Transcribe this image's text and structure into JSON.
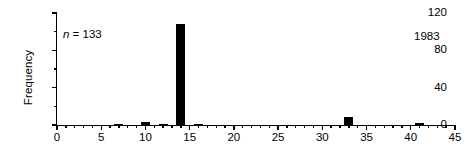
{
  "chart_data": {
    "type": "bar",
    "title": "",
    "xlabel": "",
    "ylabel": "Frequency",
    "xlim": [
      0,
      45
    ],
    "ylim": [
      0,
      120
    ],
    "grid": false,
    "legend": null,
    "x_major_ticks": [
      0,
      5,
      10,
      15,
      20,
      25,
      30,
      35,
      40,
      45
    ],
    "x_major_tick_labels": [
      "0",
      "5",
      "10",
      "15",
      "20",
      "25",
      "30",
      "35",
      "40",
      "45"
    ],
    "x_minor_tick_step": 1,
    "y_major_ticks": [
      0,
      40,
      80,
      120
    ],
    "y_major_tick_labels": [
      "0",
      "40",
      "80",
      "120"
    ],
    "y_minor_ticks": [
      20,
      60,
      100
    ],
    "bar_color": "#000000",
    "bar_width_units": 1,
    "x": [
      7,
      10,
      12,
      14,
      16,
      33,
      41
    ],
    "values": [
      1,
      3,
      1,
      108,
      1,
      9,
      2
    ],
    "annotations": [
      {
        "name": "sample-size",
        "text": "n = 133",
        "x_units": 0.7,
        "y_units": 97
      },
      {
        "name": "year",
        "text": "1983",
        "x_units": 40.4,
        "y_units": 95
      }
    ]
  },
  "annotations": {
    "sample_size_italic": "n",
    "sample_size_rest": " = 133",
    "year": "1983"
  },
  "axes": {
    "ylabel": "Frequency"
  }
}
